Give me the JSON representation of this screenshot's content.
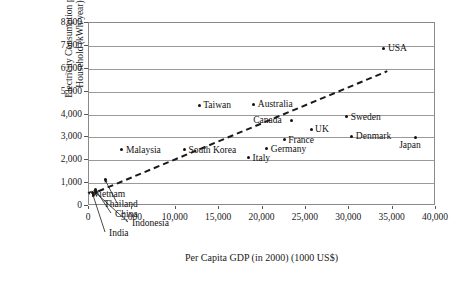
{
  "chart_data": {
    "type": "scatter",
    "title": "",
    "xlabel": "Per Capita GDP (in 2000) (1000 US$)",
    "ylabel_line1": "Electricity Consumption per",
    "ylabel_line2": "Household (kWh/year)",
    "xlim": [
      0,
      40000
    ],
    "ylim": [
      0,
      8000
    ],
    "grid": "horizontal",
    "legend": "none",
    "xticks": [
      "0",
      "5,000",
      "10,000",
      "15,000",
      "20,000",
      "25,000",
      "30,000",
      "35,000",
      "40,000"
    ],
    "xtick_values": [
      0,
      5000,
      10000,
      15000,
      20000,
      25000,
      30000,
      35000,
      40000
    ],
    "yticks": [
      "0",
      "1,000",
      "2,000",
      "3,000",
      "4,000",
      "5,000",
      "6,000",
      "7,000",
      "8,000"
    ],
    "ytick_values": [
      0,
      1000,
      2000,
      3000,
      4000,
      5000,
      6000,
      7000,
      8000
    ],
    "points": [
      {
        "name": "USA",
        "x": 34000,
        "y": 6900,
        "label_pos": "right"
      },
      {
        "name": "Taiwan",
        "x": 12700,
        "y": 4400,
        "label_pos": "right"
      },
      {
        "name": "Australia",
        "x": 19000,
        "y": 4450,
        "label_pos": "right"
      },
      {
        "name": "Canada",
        "x": 23300,
        "y": 3750,
        "label_pos": "left"
      },
      {
        "name": "Sweden",
        "x": 29700,
        "y": 3900,
        "label_pos": "right"
      },
      {
        "name": "UK",
        "x": 25600,
        "y": 3350,
        "label_pos": "right"
      },
      {
        "name": "Denmark",
        "x": 30300,
        "y": 3050,
        "label_pos": "right"
      },
      {
        "name": "Japan",
        "x": 37600,
        "y": 3000,
        "label_pos": "below"
      },
      {
        "name": "France",
        "x": 22500,
        "y": 2900,
        "label_pos": "right"
      },
      {
        "name": "Germany",
        "x": 20500,
        "y": 2500,
        "label_pos": "right"
      },
      {
        "name": "Italy",
        "x": 18400,
        "y": 2100,
        "label_pos": "right"
      },
      {
        "name": "South Korea",
        "x": 11000,
        "y": 2450,
        "label_pos": "right"
      },
      {
        "name": "Malaysia",
        "x": 3800,
        "y": 2450,
        "label_pos": "right"
      },
      {
        "name": "Vietnam",
        "x": 400,
        "y": 600,
        "label_pos": "callout"
      },
      {
        "name": "Thailand",
        "x": 1900,
        "y": 1150,
        "label_pos": "callout"
      },
      {
        "name": "China",
        "x": 800,
        "y": 700,
        "label_pos": "callout"
      },
      {
        "name": "Indonesia",
        "x": 700,
        "y": 600,
        "label_pos": "callout"
      },
      {
        "name": "India",
        "x": 500,
        "y": 520,
        "label_pos": "callout"
      }
    ],
    "trendline": {
      "style": "dashed",
      "color": "#1a1a1a",
      "x_start": 1200,
      "y_start": 600,
      "x_end": 34500,
      "y_end": 5850
    }
  },
  "labels": {
    "usa": "USA",
    "taiwan": "Taiwan",
    "australia": "Australia",
    "canada": "Canada",
    "sweden": "Sweden",
    "uk": "UK",
    "denmark": "Denmark",
    "japan": "Japan",
    "france": "France",
    "germany": "Germany",
    "italy": "Italy",
    "south_korea": "South Korea",
    "malaysia": "Malaysia",
    "vietnam": "Vietnam",
    "thailand": "Thailand",
    "china": "China",
    "indonesia": "Indonesia",
    "india": "India"
  },
  "colors": {
    "point": "#111111",
    "axis": "#8a8a8a",
    "grid": "#9a9a9a",
    "text": "#1a1a1a",
    "trend": "#1a1a1a"
  }
}
